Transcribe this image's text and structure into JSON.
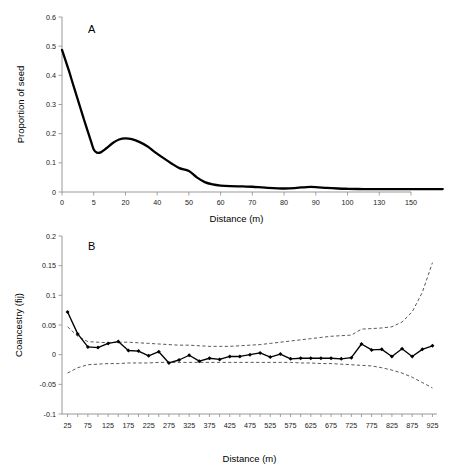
{
  "chart_data": [
    {
      "id": "panel-a",
      "type": "line",
      "panel_label": "A",
      "title": "",
      "xlabel": "Distance (m)",
      "ylabel": "Proportion of seed",
      "x_tick_labels": [
        "0",
        "5",
        "20",
        "40",
        "50",
        "60",
        "70",
        "80",
        "90",
        "100",
        "130",
        "150"
      ],
      "x_categorical": true,
      "ylim": [
        0,
        0.6
      ],
      "y_tick_labels": [
        "0",
        "0.1",
        "0.2",
        "0.3",
        "0.4",
        "0.5",
        "0.6"
      ],
      "y_ticks": [
        0,
        0.1,
        0.2,
        0.3,
        0.4,
        0.5,
        0.6
      ],
      "grid": false,
      "legend": "none",
      "categories": [
        0,
        5,
        20,
        40,
        50,
        60,
        70,
        80,
        90,
        100,
        130,
        150
      ],
      "values": [
        0.487,
        0.146,
        0.184,
        0.072,
        0.022,
        0.018,
        0.012,
        0.017,
        0.011,
        0.01,
        0.01,
        0.01
      ],
      "curve_points": [
        [
          0.0,
          0.487
        ],
        [
          0.1,
          0.455
        ],
        [
          0.22,
          0.415
        ],
        [
          0.34,
          0.372
        ],
        [
          0.46,
          0.33
        ],
        [
          0.58,
          0.288
        ],
        [
          0.7,
          0.246
        ],
        [
          0.82,
          0.205
        ],
        [
          0.92,
          0.172
        ],
        [
          1.0,
          0.146
        ],
        [
          1.1,
          0.135
        ],
        [
          1.22,
          0.136
        ],
        [
          1.4,
          0.15
        ],
        [
          1.6,
          0.168
        ],
        [
          1.8,
          0.18
        ],
        [
          2.0,
          0.184
        ],
        [
          2.2,
          0.181
        ],
        [
          2.45,
          0.171
        ],
        [
          2.7,
          0.156
        ],
        [
          2.95,
          0.135
        ],
        [
          3.2,
          0.116
        ],
        [
          3.45,
          0.098
        ],
        [
          3.7,
          0.082
        ],
        [
          4.0,
          0.072
        ],
        [
          4.25,
          0.05
        ],
        [
          4.5,
          0.034
        ],
        [
          4.75,
          0.026
        ],
        [
          5.0,
          0.022
        ],
        [
          5.3,
          0.02
        ],
        [
          5.7,
          0.019
        ],
        [
          6.0,
          0.018
        ],
        [
          6.4,
          0.015
        ],
        [
          7.0,
          0.012
        ],
        [
          7.4,
          0.014
        ],
        [
          7.7,
          0.017
        ],
        [
          8.0,
          0.017
        ],
        [
          8.35,
          0.014
        ],
        [
          8.7,
          0.012
        ],
        [
          9.0,
          0.011
        ],
        [
          9.5,
          0.01
        ],
        [
          10.0,
          0.01
        ],
        [
          11.0,
          0.01
        ],
        [
          12.0,
          0.01
        ]
      ]
    },
    {
      "id": "panel-b",
      "type": "line",
      "panel_label": "B",
      "title": "",
      "xlabel": "Distance (m)",
      "ylabel": "Coancestry (fij)",
      "ylim": [
        -0.1,
        0.2
      ],
      "y_ticks": [
        -0.1,
        -0.05,
        0,
        0.05,
        0.1,
        0.15,
        0.2
      ],
      "y_tick_labels": [
        "-0.1",
        "-0.05",
        "0",
        "0.05",
        "0.1",
        "0.15",
        "0.2"
      ],
      "x_tick_labels": [
        "25",
        "75",
        "125",
        "175",
        "225",
        "275",
        "325",
        "375",
        "425",
        "475",
        "525",
        "575",
        "625",
        "675",
        "725",
        "775",
        "825",
        "875",
        "925"
      ],
      "x_tick_step": 50,
      "x_data_step": 25,
      "grid": false,
      "legend": "none",
      "x": [
        25,
        50,
        75,
        100,
        125,
        150,
        175,
        200,
        225,
        250,
        275,
        300,
        325,
        350,
        375,
        400,
        425,
        450,
        475,
        500,
        525,
        550,
        575,
        600,
        625,
        650,
        675,
        700,
        725,
        750,
        775,
        800,
        825,
        850,
        875,
        900,
        925
      ],
      "series": [
        {
          "name": "Coancestry (fij)",
          "marker": "filled-diamond",
          "values": [
            0.072,
            0.035,
            0.013,
            0.012,
            0.019,
            0.022,
            0.007,
            0.006,
            -0.002,
            0.005,
            -0.014,
            -0.009,
            -0.001,
            -0.011,
            -0.006,
            -0.008,
            -0.003,
            -0.003,
            0.0,
            0.003,
            -0.004,
            0.001,
            -0.007,
            -0.006,
            -0.006,
            -0.006,
            -0.006,
            -0.007,
            -0.005,
            0.018,
            0.008,
            0.009,
            -0.003,
            0.01,
            -0.003,
            0.009,
            0.015
          ]
        },
        {
          "name": "upper confidence limit",
          "style": "dashed",
          "values": [
            0.047,
            0.031,
            0.022,
            0.021,
            0.02,
            0.021,
            0.021,
            0.02,
            0.019,
            0.018,
            0.017,
            0.016,
            0.016,
            0.015,
            0.014,
            0.014,
            0.014,
            0.015,
            0.016,
            0.017,
            0.019,
            0.021,
            0.023,
            0.025,
            0.027,
            0.029,
            0.031,
            0.032,
            0.033,
            0.043,
            0.044,
            0.045,
            0.047,
            0.055,
            0.072,
            0.105,
            0.155
          ]
        },
        {
          "name": "lower confidence limit",
          "style": "dashed",
          "values": [
            -0.031,
            -0.022,
            -0.017,
            -0.016,
            -0.015,
            -0.015,
            -0.014,
            -0.014,
            -0.014,
            -0.013,
            -0.013,
            -0.013,
            -0.013,
            -0.013,
            -0.013,
            -0.013,
            -0.013,
            -0.013,
            -0.013,
            -0.013,
            -0.013,
            -0.013,
            -0.013,
            -0.014,
            -0.014,
            -0.015,
            -0.015,
            -0.016,
            -0.017,
            -0.018,
            -0.019,
            -0.022,
            -0.026,
            -0.031,
            -0.038,
            -0.047,
            -0.056
          ]
        }
      ]
    }
  ]
}
